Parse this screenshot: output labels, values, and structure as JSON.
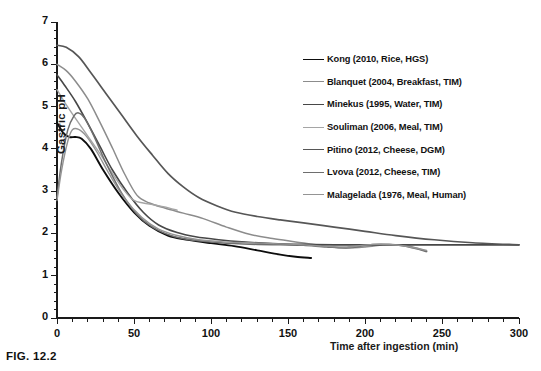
{
  "figure": {
    "caption": "FIG. 12.2"
  },
  "chart_data": {
    "type": "line",
    "title": "",
    "xlabel": "Time after ingestion (min)",
    "ylabel": "Gastric pH",
    "xlim": [
      0,
      300
    ],
    "ylim": [
      0,
      7
    ],
    "xticks": [
      0,
      50,
      100,
      150,
      200,
      250,
      300
    ],
    "yticks": [
      0,
      1,
      2,
      3,
      4,
      5,
      6,
      7
    ],
    "xtick_labels": [
      "0",
      "50",
      "100",
      "150",
      "200",
      "250",
      "300"
    ],
    "ytick_labels": [
      "0",
      "1",
      "2",
      "3",
      "4",
      "5",
      "6",
      "7"
    ],
    "x_minor_tick_step": 10,
    "y_minor_tick_step": 0.2,
    "grid": false,
    "legend_position": "upper right inside",
    "series": [
      {
        "name": "Kong (2010, Rice, HGS)",
        "color": "#0d0d0d",
        "width": 1.9,
        "x": [
          0,
          4,
          8,
          12,
          16,
          22,
          30,
          40,
          50,
          60,
          72,
          85,
          100,
          115,
          130,
          145,
          155,
          165
        ],
        "y": [
          4.62,
          4.38,
          4.28,
          4.28,
          4.24,
          4.0,
          3.5,
          2.95,
          2.5,
          2.18,
          1.95,
          1.85,
          1.77,
          1.7,
          1.6,
          1.5,
          1.45,
          1.42
        ]
      },
      {
        "name": "Blanquet (2004, Breakfast, TIM)",
        "color": "#8c8c8c",
        "width": 1.5,
        "x": [
          0,
          6,
          12,
          20,
          28,
          36,
          44,
          52,
          60,
          70,
          82,
          95,
          110,
          125,
          140,
          155,
          170,
          185,
          200,
          215,
          228,
          240
        ],
        "y": [
          6.0,
          5.85,
          5.6,
          5.18,
          4.62,
          4.02,
          3.4,
          2.9,
          2.72,
          2.6,
          2.48,
          2.35,
          2.15,
          1.98,
          1.88,
          1.8,
          1.72,
          1.66,
          1.68,
          1.74,
          1.7,
          1.58
        ]
      },
      {
        "name": "Minekus (1995, Water, TIM)",
        "color": "#474747",
        "width": 1.6,
        "x": [
          0,
          5,
          12,
          20,
          28,
          36,
          46,
          56,
          66,
          78,
          90,
          105,
          120,
          140,
          160,
          180,
          205,
          230,
          255,
          280,
          300
        ],
        "y": [
          5.75,
          5.5,
          5.12,
          4.6,
          4.05,
          3.5,
          2.95,
          2.5,
          2.2,
          2.02,
          1.92,
          1.85,
          1.8,
          1.76,
          1.74,
          1.73,
          1.73,
          1.73,
          1.73,
          1.73,
          1.73
        ]
      },
      {
        "name": "Souliman (2006, Meal, TIM)",
        "color": "#a5a5a5",
        "width": 1.4,
        "x": [
          0,
          5,
          12,
          20,
          28,
          36,
          44,
          50,
          56,
          62,
          68,
          73,
          78
        ],
        "y": [
          5.4,
          5.1,
          4.72,
          4.3,
          3.88,
          3.42,
          3.0,
          2.78,
          2.72,
          2.68,
          2.64,
          2.6,
          2.55
        ]
      },
      {
        "name": "Pitino (2012, Cheese, DGM)",
        "color": "#565656",
        "width": 1.7,
        "x": [
          0,
          6,
          14,
          22,
          32,
          42,
          52,
          62,
          72,
          82,
          92,
          104,
          116,
          130,
          145,
          160,
          180,
          200,
          220,
          245,
          270,
          300
        ],
        "y": [
          6.45,
          6.4,
          6.18,
          5.8,
          5.3,
          4.8,
          4.3,
          3.85,
          3.42,
          3.1,
          2.85,
          2.65,
          2.5,
          2.4,
          2.32,
          2.25,
          2.15,
          2.05,
          1.95,
          1.85,
          1.78,
          1.73
        ]
      },
      {
        "name": "Lvova (2012, Cheese, TIM)",
        "color": "#6e6e6e",
        "width": 1.5,
        "x": [
          0,
          3,
          7,
          11,
          14,
          18,
          24,
          32,
          42,
          52,
          62,
          74,
          86,
          100,
          115,
          130,
          145,
          160,
          175,
          190,
          205,
          220,
          232,
          240
        ],
        "y": [
          2.85,
          3.7,
          4.45,
          4.78,
          4.85,
          4.72,
          4.3,
          3.65,
          2.95,
          2.45,
          2.15,
          1.95,
          1.85,
          1.8,
          1.76,
          1.74,
          1.73,
          1.72,
          1.68,
          1.66,
          1.74,
          1.73,
          1.65,
          1.57
        ]
      },
      {
        "name": "Malagelada (1976, Meal, Human)",
        "color": "#949494",
        "width": 1.4,
        "x": [
          0,
          3,
          7,
          10,
          14,
          19,
          26,
          34,
          44,
          55,
          66,
          78,
          92,
          108,
          124,
          140,
          156,
          172,
          188,
          205,
          222,
          240
        ],
        "y": [
          2.78,
          3.5,
          4.18,
          4.45,
          4.46,
          4.3,
          3.92,
          3.4,
          2.82,
          2.38,
          2.1,
          1.95,
          1.85,
          1.8,
          1.78,
          1.76,
          1.74,
          1.7,
          1.68,
          1.74,
          1.72,
          1.6
        ]
      }
    ]
  },
  "legend": {
    "items": [
      {
        "label": "Kong (2010, Rice, HGS)",
        "color": "#0d0d0d"
      },
      {
        "label": "Blanquet (2004, Breakfast, TIM)",
        "color": "#8c8c8c"
      },
      {
        "label": "Minekus (1995, Water, TIM)",
        "color": "#474747"
      },
      {
        "label": "Souliman (2006, Meal, TIM)",
        "color": "#a5a5a5"
      },
      {
        "label": "Pitino (2012, Cheese, DGM)",
        "color": "#565656"
      },
      {
        "label": "Lvova (2012, Cheese, TIM)",
        "color": "#6e6e6e"
      },
      {
        "label": "Malagelada (1976, Meal, Human)",
        "color": "#949494"
      }
    ]
  }
}
